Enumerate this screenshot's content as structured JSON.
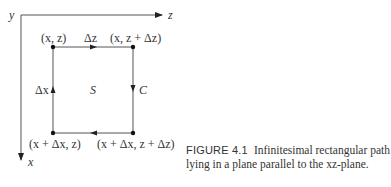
{
  "figure": {
    "axes": {
      "y_label": "y",
      "z_label": "z",
      "x_label": "x"
    },
    "corners": {
      "top_left": "(x, z)",
      "top_right": "(x, z + Δz)",
      "bottom_left": "(x + Δx, z)",
      "bottom_right": "(x + Δx, z + Δz)"
    },
    "edge_labels": {
      "top": "Δz",
      "left": "Δx",
      "right": "C",
      "center": "S"
    },
    "caption": {
      "number": "FIGURE 4.1",
      "text": "Infinitesimal rectangular path lying in a plane parallel to the xz-plane."
    }
  }
}
